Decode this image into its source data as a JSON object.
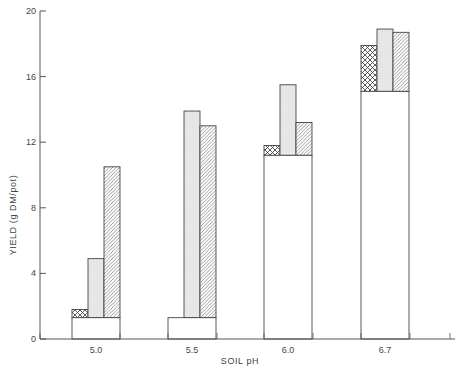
{
  "chart_data": {
    "type": "bar",
    "title": "",
    "xlabel": "SOIL pH",
    "ylabel": "YIELD (g DM/pot)",
    "ylim": [
      0,
      20
    ],
    "yticks": [
      0,
      4,
      8,
      12,
      16,
      20
    ],
    "grid": false,
    "legend": null,
    "categories": [
      "5.0",
      "5.5",
      "6.0",
      "6.7"
    ],
    "base": {
      "name": "base (open box)",
      "pattern": "open",
      "values": [
        1.3,
        1.3,
        11.2,
        15.1
      ]
    },
    "series": [
      {
        "name": "cross-hatched",
        "pattern": "crosshatch",
        "values": [
          1.8,
          0,
          11.8,
          17.9
        ]
      },
      {
        "name": "stippled",
        "pattern": "stipple",
        "values": [
          4.9,
          13.9,
          15.5,
          18.9
        ]
      },
      {
        "name": "diagonal-hatched",
        "pattern": "diagonal",
        "values": [
          10.5,
          13.0,
          13.2,
          18.7
        ]
      }
    ]
  },
  "colors": {
    "axis": "#555555",
    "outline": "#444444",
    "stipple": "#e6e6e6",
    "background": "#ffffff"
  }
}
